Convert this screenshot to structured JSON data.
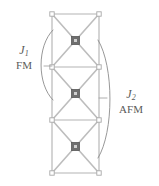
{
  "figure": {
    "background_color": "#ffffff",
    "line_color": "#b4b4b4",
    "node_color": "#6e6e6e",
    "node_inner_color": "#cfcfcf",
    "brace_color": "#8c8c8c",
    "text_color": "#5a5a5a"
  },
  "lattice": {
    "description": "Vertical stack of three square plaquettes, each crossed by two diagonals, with a filled square site at every plaquette centre and open sites at the corners.",
    "cell_count": 3,
    "left_x": 52,
    "right_x": 99,
    "top_y": 14,
    "bottom_y": 173,
    "row_boundaries_y": [
      14,
      67,
      120,
      173
    ],
    "center_nodes": [
      {
        "label": "site-1",
        "x": 75.5,
        "y": 40.5
      },
      {
        "label": "site-2",
        "x": 75.5,
        "y": 93.5
      },
      {
        "label": "site-3",
        "x": 75.5,
        "y": 146.5
      }
    ],
    "corner_nodes": [
      {
        "x": 52,
        "y": 14
      },
      {
        "x": 99,
        "y": 14
      },
      {
        "x": 52,
        "y": 67
      },
      {
        "x": 99,
        "y": 67
      },
      {
        "x": 52,
        "y": 120
      },
      {
        "x": 99,
        "y": 120
      },
      {
        "x": 52,
        "y": 173
      },
      {
        "x": 99,
        "y": 173
      }
    ]
  },
  "couplings": [
    {
      "id": "j1",
      "symbol": "J",
      "subscript": "1",
      "type": "FM",
      "side": "left",
      "brace_span_y": [
        30,
        100
      ],
      "brace_bulge_x": 38
    },
    {
      "id": "j2",
      "symbol": "J",
      "subscript": "2",
      "type": "AFM",
      "side": "right",
      "brace_span_y": [
        40,
        158
      ],
      "brace_bulge_x": 113
    }
  ]
}
